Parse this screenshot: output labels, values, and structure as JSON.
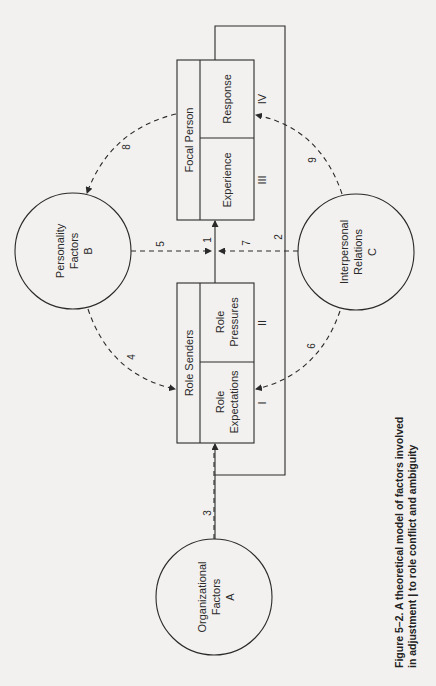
{
  "diagram": {
    "nodes": {
      "focal_person": {
        "title": "Focal Person",
        "cells": [
          {
            "label": "Experience",
            "roman": "III"
          },
          {
            "label": "Response",
            "roman": "IV"
          }
        ]
      },
      "role_senders": {
        "title": "Role Senders",
        "cells": [
          {
            "label_line1": "Role",
            "label_line2": "Expectations",
            "roman": "I"
          },
          {
            "label_line1": "Role",
            "label_line2": "Pressures",
            "roman": "II"
          }
        ]
      },
      "personality": {
        "line1": "Personality",
        "line2": "Factors",
        "letter": "B"
      },
      "interpersonal": {
        "line1": "Interpersonal",
        "line2": "Relations",
        "letter": "C"
      },
      "organizational": {
        "line1": "Organizational",
        "line2": "Factors",
        "letter": "A"
      }
    },
    "edges": [
      {
        "id": "1",
        "label": "1",
        "from": "Role Senders",
        "to": "Focal Person",
        "style": "solid"
      },
      {
        "id": "2",
        "label": "2",
        "from": "Focal Person",
        "to": "Role Senders",
        "style": "solid-feedback"
      },
      {
        "id": "3",
        "label": "3",
        "from": "Organizational Factors",
        "to": "Role Senders",
        "style": "dashed"
      },
      {
        "id": "4",
        "label": "4",
        "from": "Personality Factors",
        "to": "Role Senders",
        "style": "dashed"
      },
      {
        "id": "5",
        "label": "5",
        "from": "Personality Factors",
        "to": "edge 1",
        "style": "dashed"
      },
      {
        "id": "6",
        "label": "6",
        "from": "Interpersonal Relations",
        "to": "Role Senders",
        "style": "dashed"
      },
      {
        "id": "7",
        "label": "7",
        "from": "Interpersonal Relations",
        "to": "edge 1",
        "style": "dashed"
      },
      {
        "id": "8",
        "label": "8",
        "from": "Focal Person",
        "to": "Personality Factors",
        "style": "dashed"
      },
      {
        "id": "9",
        "label": "9",
        "from": "Interpersonal Relations",
        "to": "Focal Person",
        "style": "dashed"
      }
    ],
    "caption": {
      "line1": "Figure 5–2.  A theoretical model of factors involved",
      "line2": "in adjustment | to role conflict and ambiguity"
    }
  }
}
